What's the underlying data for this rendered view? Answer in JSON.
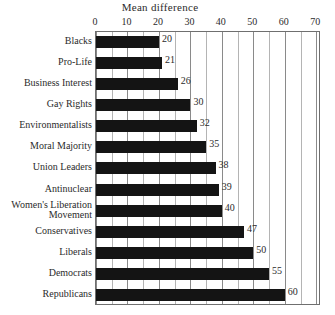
{
  "chart_data": {
    "type": "bar",
    "orientation": "horizontal",
    "title": "Mean difference",
    "xlabel": "",
    "ylabel": "",
    "xlim": [
      0,
      71.5
    ],
    "xticks": [
      0,
      10,
      20,
      30,
      40,
      50,
      60,
      70
    ],
    "xtick_labels": [
      "0",
      "10",
      "20",
      "30",
      "40",
      "50",
      "60",
      "70"
    ],
    "minor_tick_step": 5,
    "grid": "vertical",
    "legend": "none",
    "bar_color": "#141414",
    "categories": [
      "Blacks",
      "Pro-Life",
      "Business Interest",
      "Gay Rights",
      "Environmentalists",
      "Moral Majority",
      "Union Leaders",
      "Antinuclear",
      "Women's Liberation\nMovement",
      "Conservatives",
      "Liberals",
      "Democrats",
      "Republicans"
    ],
    "values": [
      20,
      21,
      26,
      30,
      32,
      35,
      38,
      39,
      40,
      47,
      50,
      55,
      60
    ],
    "data_labels": [
      "20",
      "21",
      "26",
      "30",
      "32",
      "35",
      "38",
      "39",
      "40",
      "47",
      "50",
      "55",
      "60"
    ]
  },
  "bottom_sliver": {
    "text": "· ·   ··   ·   ··"
  }
}
